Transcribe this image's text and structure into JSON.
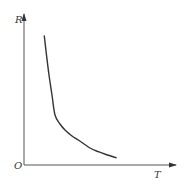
{
  "chart_data": {
    "type": "line",
    "title": "",
    "xlabel": "T",
    "ylabel": "R",
    "origin_label": "O",
    "grid": false,
    "legend": null,
    "series": [
      {
        "name": "R vs T",
        "points_px": [
          [
            44.3,
            36
          ],
          [
            46.5,
            55
          ],
          [
            49,
            75
          ],
          [
            52,
            95
          ],
          [
            55,
            115
          ],
          [
            60,
            124
          ],
          [
            65,
            130
          ],
          [
            72,
            136
          ],
          [
            78.3,
            140
          ],
          [
            90,
            148
          ],
          [
            98.3,
            151.7
          ],
          [
            106,
            154.5
          ],
          [
            116,
            157.7
          ]
        ]
      }
    ],
    "colors": {
      "axis": "#555555",
      "curve": "#333333",
      "label": "#333333"
    }
  }
}
